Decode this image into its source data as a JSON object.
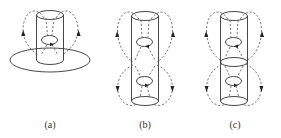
{
  "figure": {
    "panels": [
      {
        "id": "a",
        "label": "(a)",
        "elements": [
          "cylinder",
          "inner-current-ring",
          "horizontal-disk-plane",
          "dashed-field-loops-with-up-arrows"
        ]
      },
      {
        "id": "b",
        "label": "(b)",
        "elements": [
          "tall-cylinder",
          "upper-current-ring",
          "lower-current-ring",
          "upper-dashed-loops-up-arrows",
          "lower-dashed-loops-down-arrows"
        ]
      },
      {
        "id": "c",
        "label": "(c)",
        "elements": [
          "tall-cylinder-with-middle-ellipse",
          "upper-current-ring",
          "lower-current-ring",
          "upper-dashed-loops-up-arrows",
          "lower-dashed-loops-down-arrows"
        ]
      }
    ]
  },
  "colors": {
    "line": "#333333",
    "dash": "#555555",
    "background": "#ffffff"
  }
}
